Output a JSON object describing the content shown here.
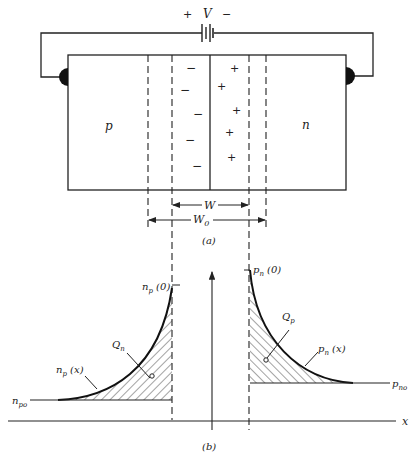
{
  "figure": {
    "part_a": {
      "caption": "(a)",
      "battery": {
        "plus": "+",
        "label": "V",
        "minus": "−"
      },
      "regions": {
        "p_label": "p",
        "n_label": "n"
      },
      "depletion_charges": {
        "negative": "−",
        "positive": "+"
      },
      "dimensions": {
        "w_label": "W",
        "w0_label": "W",
        "w0_sub": "0"
      }
    },
    "part_b": {
      "caption": "(b)",
      "axis_label": "x",
      "left": {
        "peak_label": "n",
        "peak_sub": "p",
        "peak_suffix": " (0)",
        "curve_label": "n",
        "curve_sub": "p",
        "curve_suffix": " (x)",
        "charge_label": "Q",
        "charge_sub": "n",
        "baseline_label": "n",
        "baseline_sub": "po"
      },
      "right": {
        "peak_label": "p",
        "peak_sub": "n",
        "peak_suffix": " (0)",
        "curve_label": "p",
        "curve_sub": "n",
        "curve_suffix": " (x)",
        "charge_label": "Q",
        "charge_sub": "p",
        "baseline_label": "p",
        "baseline_sub": "no"
      }
    }
  },
  "colors": {
    "ink": "#222222",
    "background": "#ffffff"
  }
}
